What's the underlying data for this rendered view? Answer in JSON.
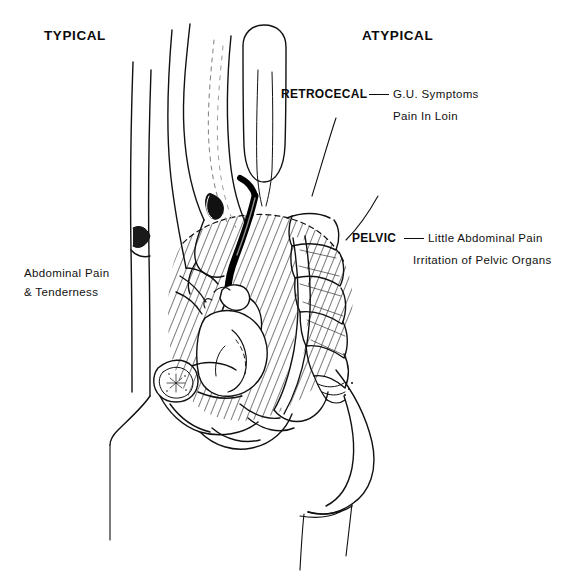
{
  "figure": {
    "title_left": "TYPICAL",
    "title_right": "ATYPICAL",
    "background_color": "#ffffff",
    "ink_color": "#111111",
    "appendix_color": "#000000",
    "hatch_color": "#1a1a1a"
  },
  "callouts": [
    {
      "id": "retrocecal",
      "term": "RETROCECAL",
      "separator": "—",
      "lines": [
        "G.U. Symptoms",
        "Pain In Loin"
      ]
    },
    {
      "id": "pelvic",
      "term": "PELVIC",
      "separator": "—",
      "lines": [
        "Little Abdominal Pain",
        "Irritation of Pelvic Organs"
      ]
    }
  ],
  "side_label": {
    "id": "typical-symptoms",
    "line1": "Abdominal Pain",
    "line2": "& Tenderness"
  },
  "anatomy": {
    "regions": [
      "abdominal-wall",
      "ascending-colon",
      "cecum",
      "appendix",
      "ileum",
      "pelvic-hatched-region",
      "sacrum-vertebrae",
      "coccyx",
      "uterus",
      "bladder",
      "rectum",
      "pubic-bone",
      "buttock",
      "thigh"
    ]
  }
}
